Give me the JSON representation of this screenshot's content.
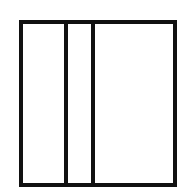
{
  "diagram": {
    "type": "partitioned-rectangle",
    "background": "#ffffff",
    "stroke_color": "#111111",
    "stroke_width": 4,
    "outer_rect": {
      "x": 21,
      "y": 22,
      "width": 154,
      "height": 163
    },
    "dividers": [
      {
        "x": 66
      },
      {
        "x": 93
      }
    ],
    "regions": [
      {
        "name": "left-region"
      },
      {
        "name": "middle-region"
      },
      {
        "name": "right-region"
      }
    ]
  }
}
